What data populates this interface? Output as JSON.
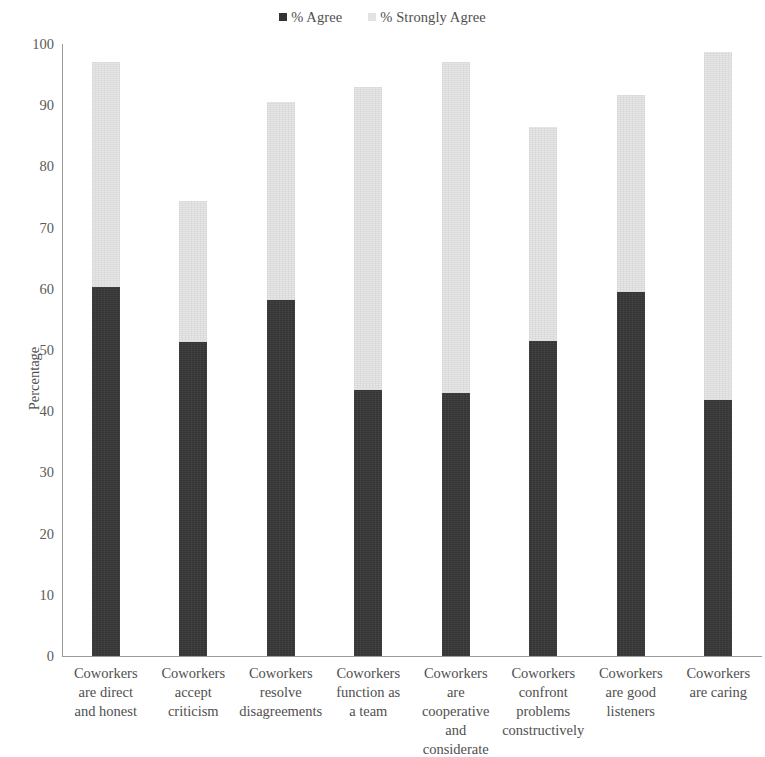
{
  "legend": {
    "position": "top-center",
    "entries": [
      {
        "label": "% Agree",
        "color": "#333333",
        "swatch": "dark"
      },
      {
        "label": "% Strongly Agree",
        "color": "#e3e3e3",
        "swatch": "light"
      }
    ]
  },
  "axes": {
    "y_title": "Percentage",
    "y_ticks": [
      "100",
      "90",
      "80",
      "70",
      "60",
      "50",
      "40",
      "30",
      "20",
      "10",
      "0"
    ]
  },
  "chart_data": {
    "type": "bar",
    "title": "",
    "subtitle": "",
    "xlabel": "",
    "ylabel": "Percentage",
    "ylim": [
      0,
      100
    ],
    "ytick_step": 10,
    "grid": false,
    "stacked": true,
    "legend_position": "top-center",
    "categories": [
      "Coworkers are direct and honest",
      "Coworkers accept criticism",
      "Coworkers resolve disagreements",
      "Coworkers function as a team",
      "Coworkers are cooperative and considerate",
      "Coworkers confront problems constructively",
      "Coworkers are good listeners",
      "Coworkers are caring"
    ],
    "category_lines": [
      [
        "Coworkers",
        "are direct",
        "and honest"
      ],
      [
        "Coworkers",
        "accept",
        "criticism"
      ],
      [
        "Coworkers",
        "resolve",
        "disagreements"
      ],
      [
        "Coworkers",
        "function as",
        "a team"
      ],
      [
        "Coworkers",
        "are",
        "cooperative",
        "and",
        "considerate"
      ],
      [
        "Coworkers",
        "confront",
        "problems",
        "constructively"
      ],
      [
        "Coworkers",
        "are good",
        "listeners"
      ],
      [
        "Coworkers",
        "are caring"
      ]
    ],
    "series": [
      {
        "name": "% Agree",
        "color": "#333333",
        "values": [
          60.3,
          51.3,
          58.2,
          43.5,
          43.0,
          51.5,
          59.5,
          41.8
        ]
      },
      {
        "name": "% Strongly Agree",
        "color": "#e3e3e3",
        "values": [
          36.7,
          23.0,
          32.3,
          49.5,
          54.0,
          35.0,
          32.2,
          56.9
        ]
      }
    ],
    "totals": [
      97.0,
      74.3,
      90.5,
      93.0,
      97.0,
      86.5,
      91.7,
      98.7
    ]
  }
}
